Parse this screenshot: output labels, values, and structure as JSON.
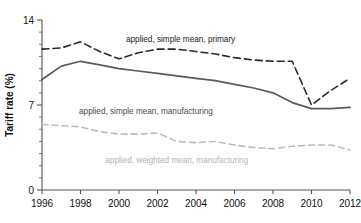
{
  "chart_data": {
    "type": "line",
    "title": "",
    "xlabel": "",
    "ylabel": "Tariff rate (%)",
    "xlim": [
      1996,
      2012
    ],
    "ylim": [
      0,
      14
    ],
    "grid": false,
    "legend_position": "inline-labels",
    "x": [
      1996,
      1997,
      1998,
      1999,
      2000,
      2001,
      2002,
      2003,
      2004,
      2005,
      2006,
      2007,
      2008,
      2009,
      2010,
      2011,
      2012
    ],
    "y_ticks": [
      0,
      7,
      14
    ],
    "y_minor_ticks": [
      1,
      2,
      3,
      4,
      5,
      6,
      8,
      9,
      10,
      11,
      12,
      13
    ],
    "x_ticks": [
      1996,
      1998,
      2000,
      2002,
      2004,
      2006,
      2008,
      2010,
      2012
    ],
    "series": [
      {
        "name": "applied, simple mean, primary",
        "style": "dashed",
        "color": "#2b2b2b",
        "values": [
          11.6,
          11.7,
          12.2,
          11.4,
          10.8,
          11.3,
          11.6,
          11.6,
          11.4,
          11.2,
          10.9,
          10.7,
          10.6,
          10.6,
          7.0,
          8.2,
          9.2
        ]
      },
      {
        "name": "applied, simple mean, manufacturing",
        "style": "solid",
        "color": "#5a5a5a",
        "values": [
          9.1,
          10.2,
          10.6,
          10.3,
          10.0,
          9.8,
          9.6,
          9.4,
          9.2,
          9.0,
          8.7,
          8.4,
          8.0,
          7.2,
          6.7,
          6.7,
          6.8
        ]
      },
      {
        "name": "applied, weighted mean, manufacturing",
        "style": "dashed",
        "color": "#bdbdbd",
        "values": [
          5.4,
          5.3,
          5.2,
          4.8,
          4.6,
          4.6,
          4.7,
          4.0,
          3.9,
          4.0,
          3.7,
          3.5,
          3.4,
          3.6,
          3.7,
          3.7,
          3.3
        ]
      }
    ],
    "annotations": [
      {
        "text": "applied, simple mean, primary",
        "x": 2003.2,
        "y": 12.2
      },
      {
        "text": "applied, simple mean, manufacturing",
        "x": 2001.4,
        "y": 6.3
      },
      {
        "text": "applied, weighted mean, manufacturing",
        "x": 2003.0,
        "y": 2.2
      }
    ]
  }
}
